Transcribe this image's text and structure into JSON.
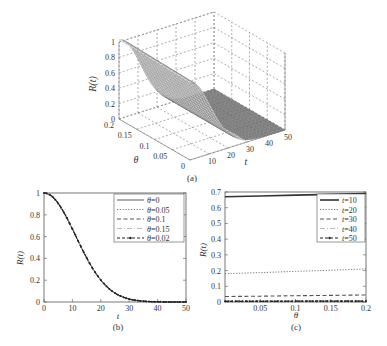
{
  "chart_data": [
    {
      "id": "a",
      "type": "surface3d",
      "caption": "(a)",
      "xlabel": "t",
      "ylabel": "θ",
      "zlabel": "R(t)",
      "x_ticks": [
        "0",
        "10",
        "20",
        "30",
        "40",
        "50"
      ],
      "y_ticks": [
        "0",
        "0.05",
        "0.1",
        "0.15",
        "0.2"
      ],
      "z_ticks": [
        "0",
        "0.2",
        "0.4",
        "0.6",
        "0.8",
        "1"
      ],
      "xlim": [
        0,
        50
      ],
      "ylim": [
        0,
        0.2
      ],
      "zlim": [
        0,
        1
      ],
      "grid": true,
      "model": "R(t) = exp(-(t/15.8)^2), nearly independent of θ",
      "t": [
        0,
        5,
        10,
        15,
        20,
        25,
        30,
        35,
        40,
        45,
        50
      ],
      "R": [
        1.0,
        0.905,
        0.67,
        0.41,
        0.2,
        0.082,
        0.027,
        0.007,
        0.0017,
        0.0003,
        0.0
      ]
    },
    {
      "id": "b",
      "type": "line",
      "caption": "(b)",
      "xlabel": "t",
      "ylabel": "R(t)",
      "x_ticks": [
        "0",
        "10",
        "20",
        "30",
        "40",
        "50"
      ],
      "y_ticks": [
        "0",
        "0.2",
        "0.4",
        "0.6",
        "0.8",
        "1"
      ],
      "xlim": [
        0,
        50
      ],
      "ylim": [
        0,
        1
      ],
      "grid": false,
      "legend_position": "upper right",
      "x": [
        0,
        2,
        4,
        6,
        8,
        10,
        12,
        14,
        16,
        18,
        20,
        22,
        24,
        26,
        28,
        30,
        32,
        34,
        36,
        38,
        40,
        42,
        44,
        46,
        48,
        50
      ],
      "series": [
        {
          "name": "θ=0",
          "style": "solid",
          "values": [
            1.0,
            0.984,
            0.938,
            0.866,
            0.774,
            0.67,
            0.562,
            0.456,
            0.358,
            0.273,
            0.201,
            0.144,
            0.1,
            0.067,
            0.043,
            0.027,
            0.017,
            0.01,
            0.006,
            0.003,
            0.002,
            0.001,
            0.0004,
            0.0002,
            0.0001,
            0.0
          ]
        },
        {
          "name": "θ=0.05",
          "style": "dotted",
          "values": [
            1.0,
            0.984,
            0.938,
            0.866,
            0.775,
            0.672,
            0.565,
            0.459,
            0.361,
            0.276,
            0.204,
            0.146,
            0.102,
            0.068,
            0.044,
            0.028,
            0.017,
            0.01,
            0.006,
            0.003,
            0.002,
            0.001,
            0.0004,
            0.0002,
            0.0001,
            0.0
          ]
        },
        {
          "name": "θ=0.1",
          "style": "dashed",
          "values": [
            1.0,
            0.984,
            0.939,
            0.867,
            0.776,
            0.675,
            0.568,
            0.462,
            0.364,
            0.279,
            0.207,
            0.149,
            0.104,
            0.07,
            0.045,
            0.029,
            0.018,
            0.011,
            0.006,
            0.003,
            0.002,
            0.001,
            0.0005,
            0.0002,
            0.0001,
            0.0
          ]
        },
        {
          "name": "θ=0.15",
          "style": "dashdot",
          "values": [
            1.0,
            0.985,
            0.939,
            0.868,
            0.778,
            0.678,
            0.571,
            0.466,
            0.368,
            0.282,
            0.21,
            0.151,
            0.106,
            0.071,
            0.046,
            0.03,
            0.018,
            0.011,
            0.006,
            0.004,
            0.002,
            0.001,
            0.0005,
            0.0002,
            0.0001,
            0.0
          ]
        },
        {
          "name": "θ=0.02",
          "style": "dashed-marker",
          "values": [
            1.0,
            0.984,
            0.938,
            0.866,
            0.774,
            0.671,
            0.563,
            0.457,
            0.359,
            0.274,
            0.202,
            0.145,
            0.101,
            0.067,
            0.043,
            0.027,
            0.017,
            0.01,
            0.006,
            0.003,
            0.002,
            0.001,
            0.0004,
            0.0002,
            0.0001,
            0.0
          ]
        }
      ]
    },
    {
      "id": "c",
      "type": "line",
      "caption": "(c)",
      "xlabel": "θ",
      "ylabel": "R(t)",
      "x_ticks": [
        "0.05",
        "0.1",
        "0.15",
        "0.2"
      ],
      "x_tick_values": [
        0.05,
        0.1,
        0.15,
        0.2
      ],
      "y_ticks": [
        "0",
        "0.1",
        "0.2",
        "0.3",
        "0.4",
        "0.5",
        "0.6",
        "0.7"
      ],
      "xlim": [
        0,
        0.2
      ],
      "ylim": [
        0,
        0.7
      ],
      "grid": false,
      "legend_position": "upper right",
      "x": [
        0,
        0.05,
        0.1,
        0.15,
        0.2
      ],
      "series": [
        {
          "name": "t=10",
          "style": "solid-thick",
          "values": [
            0.67,
            0.675,
            0.68,
            0.685,
            0.69
          ]
        },
        {
          "name": "t=20",
          "style": "dotted",
          "values": [
            0.18,
            0.187,
            0.195,
            0.202,
            0.21
          ]
        },
        {
          "name": "t=30",
          "style": "dashed",
          "values": [
            0.035,
            0.037,
            0.04,
            0.042,
            0.045
          ]
        },
        {
          "name": "t=40",
          "style": "dashdot",
          "values": [
            0.008,
            0.008,
            0.009,
            0.009,
            0.01
          ]
        },
        {
          "name": "t=50",
          "style": "dashed-marker",
          "values": [
            0.004,
            0.004,
            0.005,
            0.005,
            0.005
          ]
        }
      ]
    }
  ]
}
